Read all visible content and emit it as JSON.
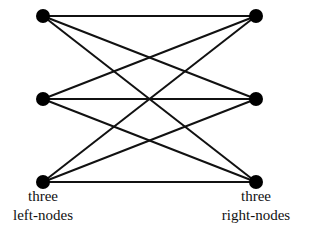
{
  "diagram": {
    "type": "complete-bipartite-graph",
    "left_nodes": [
      {
        "id": "L1",
        "x": 43,
        "y": 16
      },
      {
        "id": "L2",
        "x": 43,
        "y": 99
      },
      {
        "id": "L3",
        "x": 43,
        "y": 182
      }
    ],
    "right_nodes": [
      {
        "id": "R1",
        "x": 256,
        "y": 16
      },
      {
        "id": "R2",
        "x": 256,
        "y": 99
      },
      {
        "id": "R3",
        "x": 256,
        "y": 182
      }
    ],
    "edges": "every left node connected to every right node (9 edges)",
    "colors": {
      "stroke": "#111111",
      "node": "#000000",
      "background": "#ffffff"
    }
  },
  "labels": {
    "left_line1": "three",
    "left_line2": "left-nodes",
    "right_line1": "three",
    "right_line2": "right-nodes"
  }
}
